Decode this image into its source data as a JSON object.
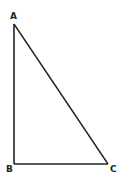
{
  "diagram": {
    "type": "right-triangle",
    "stroke_color": "#222222",
    "background": "#ffffff",
    "vertices": [
      {
        "id": "A",
        "label": "A",
        "x": 14,
        "y": 24,
        "label_x": 10,
        "label_y": 19
      },
      {
        "id": "B",
        "label": "B",
        "x": 14,
        "y": 164,
        "label_x": 6,
        "label_y": 172
      },
      {
        "id": "C",
        "label": "C",
        "x": 108,
        "y": 164,
        "label_x": 110,
        "label_y": 172
      }
    ],
    "edges": [
      {
        "from": "A",
        "to": "B"
      },
      {
        "from": "B",
        "to": "C"
      },
      {
        "from": "A",
        "to": "C"
      }
    ],
    "right_angle_at": "B"
  }
}
